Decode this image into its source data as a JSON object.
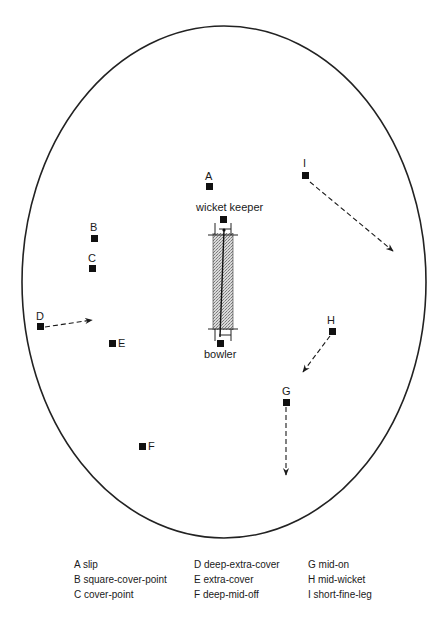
{
  "diagram": {
    "boundary": {
      "shape": "oval",
      "cx": 224,
      "cy": 282,
      "rx": 202,
      "ry": 256,
      "stroke": "#222222"
    },
    "pitch": {
      "x": 213,
      "y": 233,
      "width": 20,
      "height": 97,
      "fill_pattern": "stipple",
      "pattern_color": "#888888",
      "crease_top_y": 235,
      "crease_bottom_y": 329
    },
    "roles": {
      "wicket_keeper": {
        "label": "wicket keeper",
        "x": 196,
        "y": 211,
        "square_x": 220,
        "square_y": 216
      },
      "bowler": {
        "label": "bowler",
        "x": 204,
        "y": 358,
        "square_x": 217,
        "square_y": 340
      }
    },
    "fielders": [
      {
        "id": "A",
        "label": "A",
        "name": "slip",
        "label_x": 205,
        "label_y": 180,
        "sq_x": 206,
        "sq_y": 183,
        "arrow": null
      },
      {
        "id": "B",
        "label": "B",
        "name": "square-cover-point",
        "label_x": 90,
        "label_y": 231,
        "sq_x": 91,
        "sq_y": 235,
        "arrow": null
      },
      {
        "id": "C",
        "label": "C",
        "name": "cover-point",
        "label_x": 88,
        "label_y": 262,
        "sq_x": 89,
        "sq_y": 265,
        "arrow": null
      },
      {
        "id": "D",
        "label": "D",
        "name": "deep-extra-cover",
        "label_x": 36,
        "label_y": 320,
        "sq_x": 37,
        "sq_y": 323,
        "arrow": {
          "x1": 45,
          "y1": 327,
          "x2": 92,
          "y2": 320
        }
      },
      {
        "id": "E",
        "label": "E",
        "name": "extra-cover",
        "label_x": 118,
        "label_y": 347,
        "sq_x": 109,
        "sq_y": 340,
        "arrow": null,
        "label_side": "right"
      },
      {
        "id": "F",
        "label": "F",
        "name": "deep-mid-off",
        "label_x": 148,
        "label_y": 450,
        "sq_x": 139,
        "sq_y": 443,
        "arrow": null,
        "label_side": "right"
      },
      {
        "id": "G",
        "label": "G",
        "name": "mid-on",
        "label_x": 282,
        "label_y": 395,
        "sq_x": 283,
        "sq_y": 399,
        "arrow": {
          "x1": 286,
          "y1": 407,
          "x2": 286,
          "y2": 475
        }
      },
      {
        "id": "H",
        "label": "H",
        "name": "mid-wicket",
        "label_x": 327,
        "label_y": 324,
        "sq_x": 329,
        "sq_y": 328,
        "arrow": {
          "x1": 330,
          "y1": 336,
          "x2": 303,
          "y2": 372
        }
      },
      {
        "id": "I",
        "label": "I",
        "name": "short-fine-leg",
        "label_x": 303,
        "label_y": 167,
        "sq_x": 302,
        "sq_y": 172,
        "arrow": {
          "x1": 310,
          "y1": 182,
          "x2": 393,
          "y2": 251
        }
      }
    ]
  },
  "legend": {
    "items": [
      {
        "key": "A",
        "text": "A slip"
      },
      {
        "key": "D",
        "text": "D deep-extra-cover"
      },
      {
        "key": "G",
        "text": "G mid-on"
      },
      {
        "key": "B",
        "text": "B square-cover-point"
      },
      {
        "key": "E",
        "text": "E extra-cover"
      },
      {
        "key": "H",
        "text": "H mid-wicket"
      },
      {
        "key": "C",
        "text": "C cover-point"
      },
      {
        "key": "F",
        "text": "F deep-mid-off"
      },
      {
        "key": "I",
        "text": "I short-fine-leg"
      }
    ]
  }
}
